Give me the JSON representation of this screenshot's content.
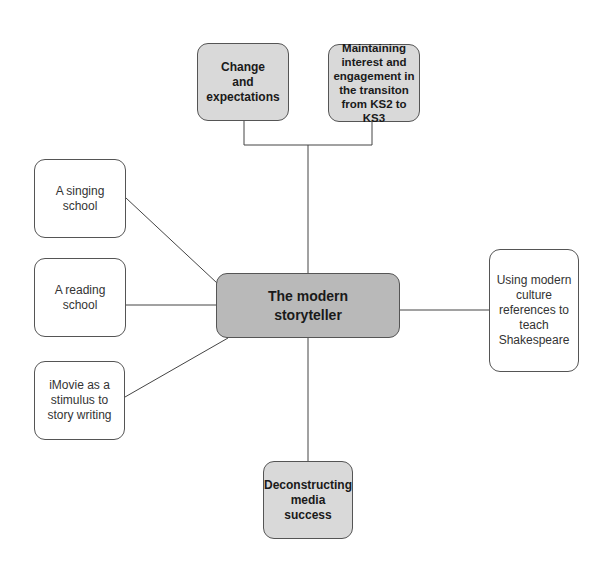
{
  "diagram": {
    "center": {
      "label": "The modern\nstoryteller"
    },
    "nodes": {
      "change": {
        "label": "Change\nand\nexpectations"
      },
      "maintaining": {
        "label": "Maintaining\ninterest and\nengagement in\nthe transiton\nfrom KS2 to KS3"
      },
      "singing": {
        "label": "A singing\nschool"
      },
      "reading": {
        "label": "A reading\nschool"
      },
      "imovie": {
        "label": "iMovie as a\nstimulus to\nstory writing"
      },
      "shakespeare": {
        "label": "Using modern\nculture\nreferences to\nteach\nShakespeare"
      },
      "deconstructing": {
        "label": "Deconstructing\nmedia\nsuccess"
      }
    },
    "colors": {
      "center_fill": "#b9b9b9",
      "highlight_fill": "#d9d9d9",
      "plain_fill": "#ffffff",
      "line": "#444444"
    }
  }
}
